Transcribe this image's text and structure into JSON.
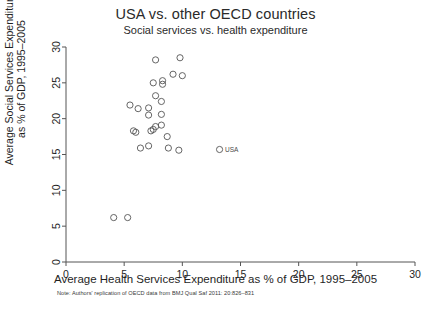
{
  "chart_data": {
    "type": "scatter",
    "title": "USA vs. other OECD countries",
    "subtitle": "Social services vs. health expenditure",
    "xlabel": "Average Health Services Expenditure as % of GDP, 1995–2005",
    "ylabel_line1": "Average Social Services Expenditure",
    "ylabel_line2": "as % of GDP, 1995–2005",
    "note": "Note: Authors' replication of OECD data from BMJ Qual Saf 2011: 20:826–831",
    "xlim": [
      0,
      30
    ],
    "ylim": [
      0,
      30
    ],
    "xticks": [
      0,
      5,
      10,
      15,
      20,
      25,
      30
    ],
    "yticks": [
      0,
      5,
      10,
      15,
      20,
      25,
      30
    ],
    "xtick_labels": [
      "0",
      "5",
      "10",
      "15",
      "20",
      "25",
      "30"
    ],
    "ytick_labels": [
      "0",
      "5",
      "10",
      "15",
      "20",
      "25",
      "30"
    ],
    "grid": false,
    "legend": null,
    "marker_style": "open-circle",
    "marker_color": "#555555",
    "points": [
      {
        "x": 7.7,
        "y": 28.2,
        "label": ""
      },
      {
        "x": 9.8,
        "y": 28.5,
        "label": ""
      },
      {
        "x": 9.2,
        "y": 26.2,
        "label": ""
      },
      {
        "x": 10.0,
        "y": 26.0,
        "label": ""
      },
      {
        "x": 7.5,
        "y": 25.0,
        "label": ""
      },
      {
        "x": 8.3,
        "y": 25.3,
        "label": ""
      },
      {
        "x": 8.3,
        "y": 24.8,
        "label": ""
      },
      {
        "x": 7.7,
        "y": 23.2,
        "label": ""
      },
      {
        "x": 8.2,
        "y": 22.4,
        "label": ""
      },
      {
        "x": 5.5,
        "y": 21.9,
        "label": ""
      },
      {
        "x": 6.2,
        "y": 21.4,
        "label": ""
      },
      {
        "x": 7.1,
        "y": 21.5,
        "label": ""
      },
      {
        "x": 7.1,
        "y": 20.5,
        "label": ""
      },
      {
        "x": 8.2,
        "y": 20.6,
        "label": ""
      },
      {
        "x": 5.8,
        "y": 18.3,
        "label": ""
      },
      {
        "x": 6.0,
        "y": 18.1,
        "label": ""
      },
      {
        "x": 7.3,
        "y": 18.3,
        "label": ""
      },
      {
        "x": 7.5,
        "y": 18.5,
        "label": ""
      },
      {
        "x": 7.7,
        "y": 18.9,
        "label": ""
      },
      {
        "x": 8.2,
        "y": 19.1,
        "label": ""
      },
      {
        "x": 8.7,
        "y": 17.5,
        "label": ""
      },
      {
        "x": 6.4,
        "y": 15.9,
        "label": ""
      },
      {
        "x": 7.1,
        "y": 16.2,
        "label": ""
      },
      {
        "x": 8.8,
        "y": 15.9,
        "label": ""
      },
      {
        "x": 9.7,
        "y": 15.6,
        "label": ""
      },
      {
        "x": 13.2,
        "y": 15.7,
        "label": "USA"
      },
      {
        "x": 4.1,
        "y": 6.2,
        "label": ""
      },
      {
        "x": 5.3,
        "y": 6.2,
        "label": ""
      }
    ]
  }
}
